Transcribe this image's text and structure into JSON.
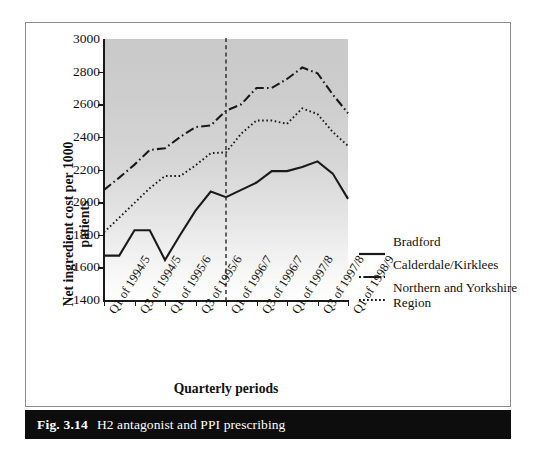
{
  "figure": {
    "caption_fig": "Fig. 3.14",
    "caption_text": "H2 antagonist and PPI prescribing"
  },
  "axes": {
    "y_title": "Net ingredient cost per 1000 patients",
    "x_title": "Quarterly periods"
  },
  "chart_data": {
    "type": "line",
    "title": "H2 antagonist and PPI prescribing",
    "xlabel": "Quarterly periods",
    "ylabel": "Net ingredient cost per 1000 patients",
    "ylim": [
      1400,
      3000
    ],
    "yticks": [
      1400,
      1600,
      1800,
      2000,
      2200,
      2400,
      2600,
      2800,
      3000
    ],
    "grid": false,
    "legend_position": "right",
    "x": [
      "Q1 of 1994/5",
      "Q2 of 1994/5",
      "Q3 of 1994/5",
      "Q4 of 1994/5",
      "Q1 of 1995/6",
      "Q2 of 1995/6",
      "Q3 of 1995/6",
      "Q4 of 1995/6",
      "Q1 of 1996/7",
      "Q2 of 1996/7",
      "Q3 of 1996/7",
      "Q4 of 1996/7",
      "Q1 of 1997/8",
      "Q2 of 1997/8",
      "Q3 of 1997/8",
      "Q4 of 1997/8",
      "Q1 of 1998/9"
    ],
    "xtick_labels": [
      "Q1 of 1994/5",
      "Q3 of 1994/5",
      "Q1 of 1995/6",
      "Q3 of 1995/6",
      "Q1 of 1996/7",
      "Q3 of 1996/7",
      "Q1 of 1997/8",
      "Q3 of 1997/8",
      "Q1 of 1998/9"
    ],
    "annotations": [
      {
        "type": "vline",
        "at_x": "Q1 of 1996/7",
        "style": "dashed",
        "label": ""
      }
    ],
    "series": [
      {
        "name": "Bradford",
        "style": "solid",
        "values": [
          1672,
          1672,
          1828,
          1828,
          1645,
          1800,
          1948,
          2065,
          2030,
          2075,
          2120,
          2190,
          2190,
          2215,
          2250,
          2175,
          2020
        ]
      },
      {
        "name": "Calderdale/Kirklees",
        "style": "dash-dot",
        "values": [
          2075,
          2150,
          2230,
          2320,
          2330,
          2400,
          2460,
          2470,
          2560,
          2600,
          2700,
          2700,
          2755,
          2825,
          2790,
          2660,
          2545
        ]
      },
      {
        "name": "Northern and Yorkshire Region",
        "style": "dotted",
        "values": [
          1815,
          1905,
          1995,
          2085,
          2160,
          2160,
          2225,
          2300,
          2305,
          2420,
          2500,
          2500,
          2480,
          2575,
          2540,
          2430,
          2345
        ]
      }
    ]
  },
  "legend": {
    "items": [
      {
        "label": "Bradford",
        "style": "solid"
      },
      {
        "label": "Calderdale/Kirklees",
        "style": "dash-dot"
      },
      {
        "label": "Northern and Yorkshire Region",
        "style": "dotted"
      }
    ]
  }
}
